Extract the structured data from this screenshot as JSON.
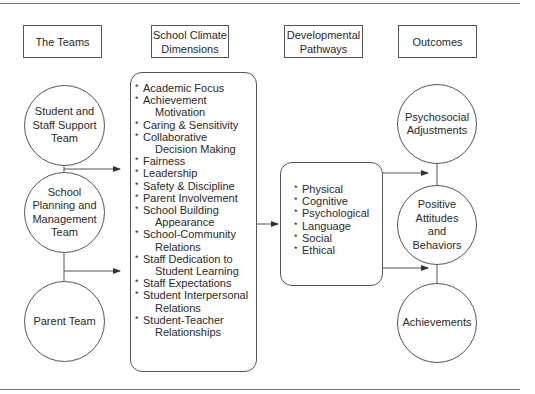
{
  "headers": {
    "teams": "The Teams",
    "climate_line1": "School Climate",
    "climate_line2": "Dimensions",
    "pathways_line1": "Developmental",
    "pathways_line2": "Pathways",
    "outcomes": "Outcomes"
  },
  "teams": [
    {
      "lines": [
        "Student and",
        "Staff Support",
        "Team"
      ]
    },
    {
      "lines": [
        "School",
        "Planning and",
        "Management",
        "Team"
      ]
    },
    {
      "lines": [
        "Parent Team"
      ]
    }
  ],
  "climate_dimensions": [
    {
      "main": "Academic Focus",
      "cont": ""
    },
    {
      "main": "Achievement",
      "cont": "Motivation"
    },
    {
      "main": "Caring & Sensitivity",
      "cont": ""
    },
    {
      "main": "Collaborative",
      "cont": "Decision Making"
    },
    {
      "main": "Fairness",
      "cont": ""
    },
    {
      "main": "Leadership",
      "cont": ""
    },
    {
      "main": "Safety & Discipline",
      "cont": ""
    },
    {
      "main": "Parent Involvement",
      "cont": ""
    },
    {
      "main": "School Building",
      "cont": "Appearance"
    },
    {
      "main": "School-Community",
      "cont": "Relations"
    },
    {
      "main": "Staff Dedication to",
      "cont": "Student Learning"
    },
    {
      "main": "Staff Expectations",
      "cont": ""
    },
    {
      "main": "Student Interpersonal",
      "cont": "Relations"
    },
    {
      "main": "Student-Teacher",
      "cont": "Relationships"
    }
  ],
  "pathways": [
    "Physical",
    "Cognitive",
    "Psychological",
    "Language",
    "Social",
    "Ethical"
  ],
  "outcomes": [
    {
      "lines": [
        "Psychosocial",
        "Adjustments"
      ]
    },
    {
      "lines": [
        "Positive",
        "Attitudes",
        "and",
        "Behaviors"
      ]
    },
    {
      "lines": [
        "Achievements"
      ]
    }
  ],
  "colors": {
    "stroke": "#555555",
    "rule": "#777777",
    "text": "#2a2a2a"
  }
}
